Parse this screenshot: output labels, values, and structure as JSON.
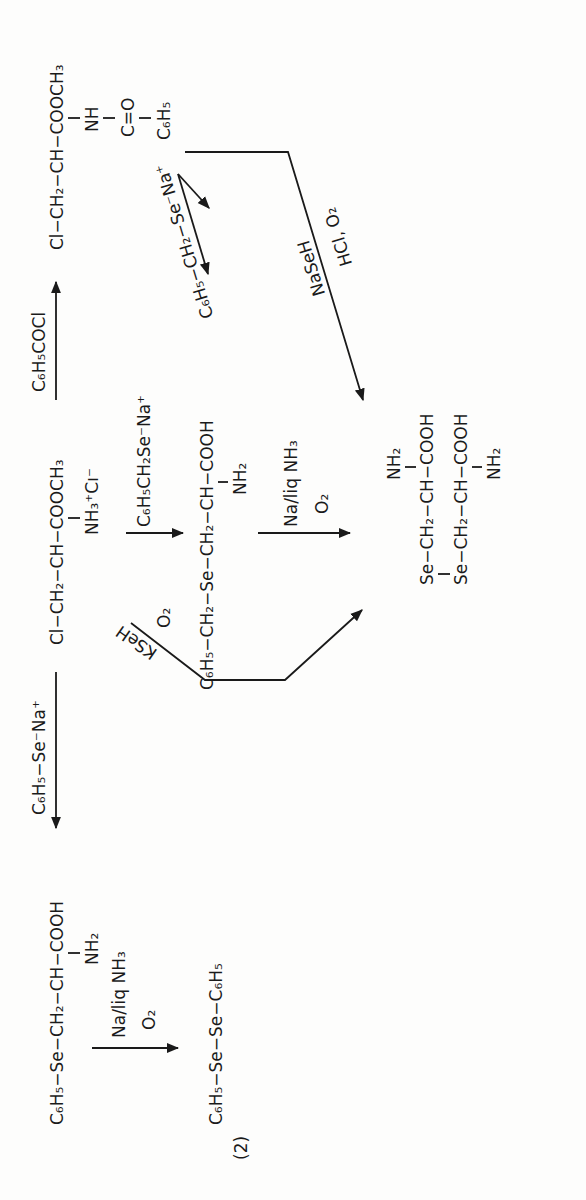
{
  "scheme_label": "(2)",
  "compounds": {
    "start_ester": {
      "main": "Cl−CH₂−CH−COOCH₃",
      "branch": "NH₃⁺Cı⁻"
    },
    "benzoyl_ester": {
      "main": "Cl−CH₂−CH−COOCH₃",
      "branch1": "NH",
      "branch2": "C=O",
      "branch3": "C₆H₅"
    },
    "benzyl_selenocysteine": {
      "main": "C₆H₅−CH₂−Se−CH₂−CH−COOH",
      "branch": "NH₂"
    },
    "phenyl_selenocysteine": {
      "main": "C₆H₅−Se−CH₂−CH−COOH",
      "branch": "NH₂"
    },
    "diphenyl_diselenide": {
      "main": "C₆H₅−Se−Se−C₆H₅"
    },
    "selenocystine": {
      "top_amine": "NH₂",
      "row1": "Se−CH₂−CH−COOH",
      "row2": "Se−CH₂−CH−COOH",
      "bottom_amine": "NH₂"
    }
  },
  "reagents": {
    "benzoylation": "C₆H₅COCl",
    "phenylselenide": "C₆H₅−Se⁻Na⁺",
    "benzylselenide_upper": "C₆H₅−CH₂−Se⁻Na⁺",
    "benzylselenide_center": "C₆H₅CH₂Se⁻Na⁺",
    "naseh": "NaSeH",
    "hcl_o2": "HCl, O₂",
    "kseh": "KSeH",
    "o2": "O₂",
    "na_liq_nh3": "Na/liq NH₃",
    "o2_b": "O₂"
  }
}
